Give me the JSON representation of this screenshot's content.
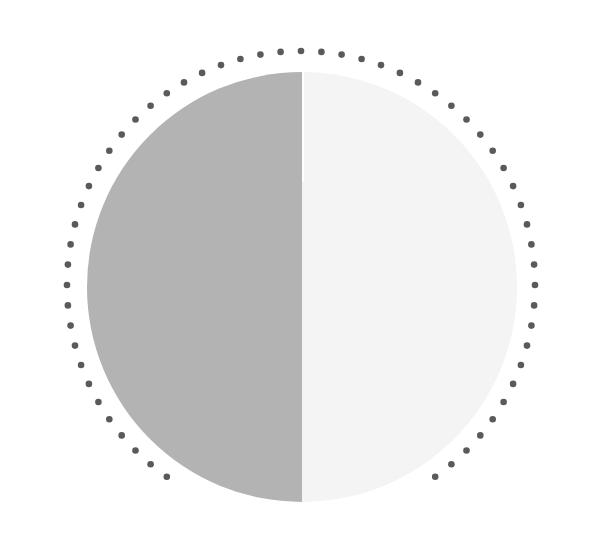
{
  "figure": {
    "colors": {
      "background": "#ffffff",
      "left_half": "#b3b3b3",
      "right_half": "#f4f4f4",
      "dots": "#5a5a5a"
    },
    "inner_circle": {
      "cx": 302,
      "cy": 287,
      "r": 215
    },
    "dotted_ring": {
      "cx": 301,
      "cy": 285,
      "r": 234,
      "dot_radius": 3.3,
      "dot_count": 72,
      "gap_start_deg": 108,
      "gap_end_deg": 145
    }
  }
}
